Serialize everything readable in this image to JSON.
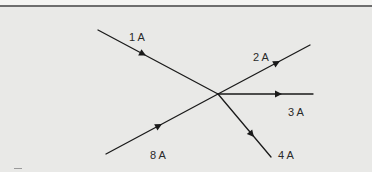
{
  "diagram": {
    "type": "kirchhoff-current-junction",
    "colors": {
      "background": "#e9e9e7",
      "line": "#1a1a1a",
      "text": "#2a2a2a",
      "top_rule": "#6e6e6e"
    },
    "junction": {
      "x": 218,
      "y": 94
    },
    "branches": [
      {
        "id": "b1",
        "label": "1 A",
        "direction": "into-junction",
        "from": [
          98,
          30
        ],
        "to": [
          218,
          94
        ],
        "label_pos": [
          129,
          32
        ]
      },
      {
        "id": "b2",
        "label": "2 A",
        "direction": "out-of-junction",
        "from": [
          218,
          94
        ],
        "to": [
          310,
          45
        ],
        "label_pos": [
          253,
          52
        ]
      },
      {
        "id": "b3",
        "label": "3 A",
        "direction": "out-of-junction",
        "from": [
          218,
          94
        ],
        "to": [
          313,
          94
        ],
        "label_pos": [
          288,
          107
        ]
      },
      {
        "id": "b4",
        "label": "4 A",
        "direction": "out-of-junction",
        "from": [
          218,
          94
        ],
        "to": [
          271,
          157
        ],
        "label_pos": [
          278,
          150
        ]
      },
      {
        "id": "b8",
        "label": "8 A",
        "direction": "into-junction",
        "from": [
          106,
          154
        ],
        "to": [
          218,
          94
        ],
        "label_pos": [
          150,
          150
        ]
      }
    ]
  }
}
